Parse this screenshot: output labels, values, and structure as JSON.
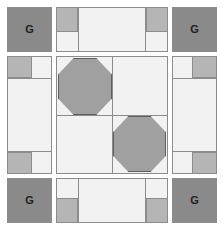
{
  "diagram": {
    "type": "patchwork-grid",
    "grid": {
      "rows": 3,
      "cols": 3
    },
    "palette": {
      "background": "#ffffff",
      "light_fabric": "#f2f2f2",
      "medium_fabric": "#b5b5b5",
      "dark_fabric": "#8a8a8a",
      "shape_fabric": "#a0a0a0",
      "seam_line": "#8c8c8c",
      "shape_outline": "#5f5f5f",
      "letter": "#1f1f1f"
    },
    "corner_blocks": [
      {
        "position": "top-left",
        "label": "G"
      },
      {
        "position": "top-right",
        "label": "G"
      },
      {
        "position": "bottom-left",
        "label": "G"
      },
      {
        "position": "bottom-right",
        "label": "G"
      }
    ],
    "edge_blocks": [
      {
        "position": "top",
        "orientation": "horizontal",
        "nubs": [
          "top-left",
          "top-right"
        ]
      },
      {
        "position": "left",
        "orientation": "vertical",
        "nubs": [
          "top-left",
          "bottom-left"
        ]
      },
      {
        "position": "right",
        "orientation": "vertical",
        "nubs": [
          "top-right",
          "bottom-right"
        ]
      },
      {
        "position": "bottom",
        "orientation": "horizontal",
        "nubs": [
          "bottom-left",
          "bottom-right"
        ]
      }
    ],
    "center_block": {
      "quadrants": [
        {
          "position": "top-left",
          "shape": "octagon"
        },
        {
          "position": "top-right",
          "shape": "none"
        },
        {
          "position": "bottom-left",
          "shape": "none"
        },
        {
          "position": "bottom-right",
          "shape": "octagon"
        }
      ],
      "octagon_count": 2
    }
  }
}
